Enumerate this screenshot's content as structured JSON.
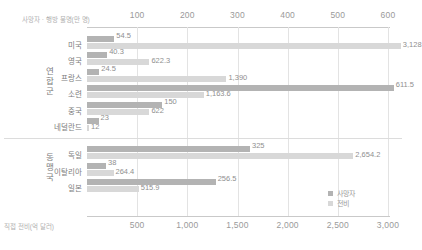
{
  "chart_data": {
    "type": "bar",
    "orientation": "horizontal",
    "title": "",
    "top_axis": {
      "caption": "사망자 · 행방 불명(만 명)",
      "ticks": [
        100,
        200,
        300,
        400,
        500,
        600
      ],
      "tick_labels": [
        "100",
        "200",
        "300",
        "400",
        "500",
        "600"
      ],
      "range": [
        0,
        600
      ],
      "unit": "만 명"
    },
    "bottom_axis": {
      "caption": "직접 전비(억 달러)",
      "ticks": [
        500,
        1000,
        1500,
        2000,
        2500,
        3000
      ],
      "tick_labels": [
        "500",
        "1,000",
        "1,500",
        "2,000",
        "2,500",
        "3,000"
      ],
      "range": [
        0,
        3000
      ],
      "unit": "억 달러"
    },
    "legend": {
      "position": "bottom-right",
      "entries": [
        {
          "name": "사망자",
          "color": "#b3b3b3"
        },
        {
          "name": "전비",
          "color": "#d8d8d8"
        }
      ]
    },
    "series": [
      {
        "name": "사망자",
        "axis": "top",
        "color": "#b3b3b3"
      },
      {
        "name": "전비",
        "axis": "bottom",
        "color": "#d8d8d8"
      }
    ],
    "groups": [
      {
        "label": "연합군",
        "categories": [
          "미국",
          "영국",
          "프랑스",
          "소련",
          "중국",
          "네덜란드"
        ],
        "deaths": [
          54.5,
          40.3,
          24.5,
          611.5,
          150,
          23
        ],
        "deaths_labels": [
          "54.5",
          "40.3",
          "24.5",
          "611.5",
          "150",
          "23"
        ],
        "cost": [
          3128,
          622.3,
          1390,
          1163.6,
          622,
          12
        ],
        "cost_labels": [
          "3,128",
          "622.3",
          "1,390",
          "1,163.6",
          "622",
          "12"
        ]
      },
      {
        "label": "동맹국",
        "categories": [
          "독일",
          "이탈리아",
          "일본"
        ],
        "deaths": [
          325,
          38,
          256.5
        ],
        "deaths_labels": [
          "325",
          "38",
          "256.5"
        ],
        "cost": [
          2654.2,
          264.4,
          515.9
        ],
        "cost_labels": [
          "2,654.2",
          "264.4",
          "515.9"
        ]
      }
    ]
  }
}
